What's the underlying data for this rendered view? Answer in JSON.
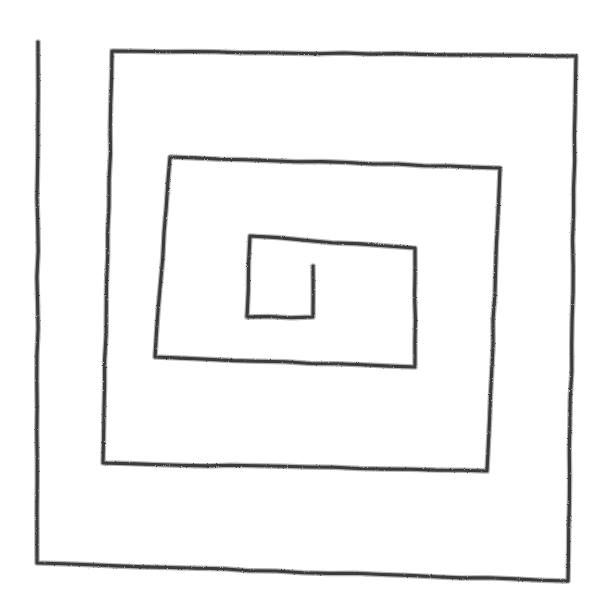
{
  "image": {
    "title": "Hand-drawn rectangular spiral",
    "subject": "rectangular-spiral",
    "medium": "pencil sketch on white paper",
    "width": 603,
    "height": 613,
    "background_color": "#ffffff",
    "stroke_color": "#3a3a3a",
    "stroke_width": 3.1,
    "texture": "rough graphite line with grainy speckled edges",
    "turn_count": 4,
    "winding_direction": "clockwise-inward",
    "open_ends": 2,
    "shape_family": "square-spiral"
  },
  "drawing": {
    "type": "polyline",
    "description": "Single continuous open polyline spiralling clockwise from an outer free end at the upper-left, inward through four rectangular turns, ending in a short vertical stub near the centre.",
    "start_point": {
      "x": 38,
      "y": 42,
      "label": "outer-free-end-top-left"
    },
    "end_point": {
      "x": 313,
      "y": 266,
      "label": "inner-free-end-centre"
    },
    "points": [
      {
        "x": 38,
        "y": 42
      },
      {
        "x": 37,
        "y": 563
      },
      {
        "x": 568,
        "y": 581
      },
      {
        "x": 576,
        "y": 56
      },
      {
        "x": 112,
        "y": 51
      },
      {
        "x": 103,
        "y": 463
      },
      {
        "x": 487,
        "y": 471
      },
      {
        "x": 500,
        "y": 168
      },
      {
        "x": 170,
        "y": 157
      },
      {
        "x": 155,
        "y": 357
      },
      {
        "x": 415,
        "y": 367
      },
      {
        "x": 415,
        "y": 248
      },
      {
        "x": 250,
        "y": 236
      },
      {
        "x": 247,
        "y": 317
      },
      {
        "x": 313,
        "y": 317
      },
      {
        "x": 313,
        "y": 266
      }
    ],
    "ring_bounds": [
      {
        "ring": 1,
        "name": "outermost",
        "left": 38,
        "top": 42,
        "right": 576,
        "bottom": 581
      },
      {
        "ring": 2,
        "name": "second",
        "left": 103,
        "top": 51,
        "right": 500,
        "bottom": 471
      },
      {
        "ring": 3,
        "name": "third",
        "left": 155,
        "top": 157,
        "right": 415,
        "bottom": 367
      },
      {
        "ring": 4,
        "name": "innermost",
        "left": 247,
        "top": 236,
        "right": 313,
        "bottom": 317
      }
    ]
  }
}
